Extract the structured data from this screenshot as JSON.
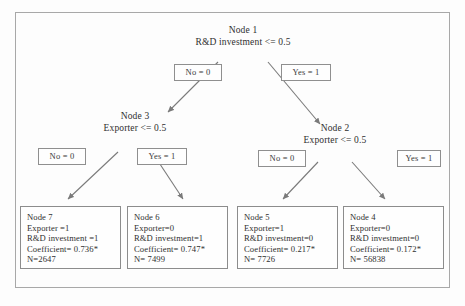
{
  "figure": {
    "type": "decision-tree-diagram",
    "root": {
      "id": "Node 1",
      "condition": "R&D investment <= 0.5"
    },
    "edge_labels": {
      "no": "No = 0",
      "yes": "Yes = 1"
    },
    "internal_nodes": [
      {
        "id": "Node 3",
        "condition": "Exporter <= 0.5",
        "branch_from_root": "No = 0"
      },
      {
        "id": "Node 2",
        "condition": "Exporter <= 0.5",
        "branch_from_root": "Yes = 1"
      }
    ],
    "edges": [
      {
        "from": "Node 1",
        "to": "Node 3",
        "label": "No = 0"
      },
      {
        "from": "Node 1",
        "to": "Node 2",
        "label": "Yes = 1"
      },
      {
        "from": "Node 3",
        "to": "Node 7",
        "label": "No = 0"
      },
      {
        "from": "Node 3",
        "to": "Node 6",
        "label": "Yes = 1"
      },
      {
        "from": "Node 2",
        "to": "Node 5",
        "label": "No = 0"
      },
      {
        "from": "Node 2",
        "to": "Node 4",
        "label": "Yes = 1"
      }
    ],
    "leaves": [
      {
        "id": "Node 7",
        "exporter": "Exporter =1",
        "rd": "R&D investment =1",
        "coefficient": "Coefficient= 0.736*",
        "n": "N=2647"
      },
      {
        "id": "Node 6",
        "exporter": "Exporter=0",
        "rd": "R&D investment=1",
        "coefficient": "Coefficient= 0.747*",
        "n": "N= 7499"
      },
      {
        "id": "Node 5",
        "exporter": "Exporter=1",
        "rd": "R&D investment=0",
        "coefficient": "Coefficient= 0.217*",
        "n": "N= 7726"
      },
      {
        "id": "Node 4",
        "exporter": "Exporter=0",
        "rd": "R&D investment=0",
        "coefficient": "Coefficient= 0.172*",
        "n": "N= 56838"
      }
    ],
    "row2_edge_labels": {
      "left_no": "No = 0",
      "left_yes": "Yes = 1",
      "right_no": "No = 0",
      "right_yes": "Yes = 1"
    },
    "colors": {
      "border": "#8c8c8c",
      "text": "#2f2f2f",
      "arrow": "#7a7a7a",
      "frame": "#a8a8a8"
    }
  }
}
